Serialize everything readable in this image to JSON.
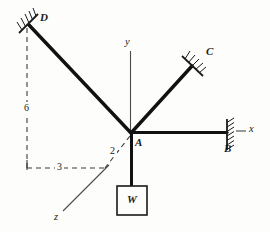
{
  "figure": {
    "background_color": "#fdfdfc",
    "line_color": "#1a1a1a",
    "member_color": "#111111"
  },
  "joints": {
    "a": {
      "label": "A",
      "x": 131,
      "y": 133
    },
    "b": {
      "label": "B",
      "x": 227,
      "y": 133
    },
    "c": {
      "label": "C",
      "x": 193,
      "y": 65
    },
    "d": {
      "label": "D",
      "x": 28,
      "y": 24
    }
  },
  "axes": {
    "x": {
      "label": "x"
    },
    "y": {
      "label": "y"
    },
    "z": {
      "label": "z"
    }
  },
  "dimensions": [
    {
      "name": "vertical-dimension",
      "label": "6"
    },
    {
      "name": "horizontal-dimension",
      "label": "3"
    },
    {
      "name": "depth-dimension",
      "label": "2"
    }
  ],
  "load": {
    "label": "W",
    "name": "weight-block"
  },
  "supports": [
    {
      "name": "support-b",
      "label": "B"
    },
    {
      "name": "support-c",
      "label": "C"
    },
    {
      "name": "support-d",
      "label": "D"
    }
  ]
}
